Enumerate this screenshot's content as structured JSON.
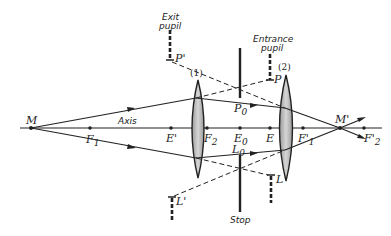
{
  "diagram": {
    "axis_label": "Axis",
    "points": {
      "M": "M",
      "F1": "F",
      "F1_sub": "1",
      "E_prime": "E'",
      "F2": "F",
      "F2_sub": "2",
      "E0": "E",
      "E0_sub": "0",
      "E": "E",
      "F1_prime": "F'",
      "F1_prime_sub": "1",
      "M_prime": "M'",
      "F2_prime": "F'",
      "F2_prime_sub": "2",
      "P0": "P",
      "P0_sub": "0",
      "L0": "L",
      "L0_sub": "0",
      "P": "P",
      "P_prime": "P'",
      "L": "L",
      "L_prime": "L'"
    },
    "lenses": [
      {
        "label": "(1)"
      },
      {
        "label": "(2)"
      }
    ],
    "annotations": {
      "exit_pupil_line1": "Exit",
      "exit_pupil_line2": "pupil",
      "entrance_pupil_line1": "Entrance",
      "entrance_pupil_line2": "pupil",
      "stop": "Stop"
    },
    "colors": {
      "ink": "#222222",
      "lens_fill": "#bdbdbd",
      "background": "#ffffff"
    }
  }
}
